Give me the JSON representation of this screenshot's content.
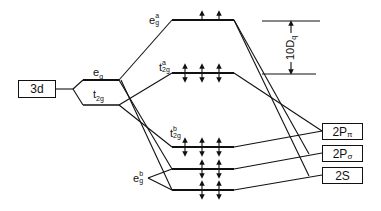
{
  "diagram": {
    "metal_orbital": {
      "label": "3d"
    },
    "metal_split_levels": [
      {
        "name": "eg",
        "main": "e",
        "sub": "g"
      },
      {
        "name": "t2g",
        "main": "t",
        "sub": "2g"
      }
    ],
    "mo_levels": [
      {
        "name": "eg_antibonding",
        "main": "e",
        "sub": "g",
        "sup": "a",
        "electrons": "2 up arrows"
      },
      {
        "name": "t2g_antibonding",
        "main": "t",
        "sub": "2g",
        "sup": "a",
        "electrons": "3 paired (double-headed arrows)"
      },
      {
        "name": "t2g_bonding",
        "main": "t",
        "sub": "2g",
        "sup": "b",
        "electrons": "3 paired (double-headed arrows)"
      },
      {
        "name": "eg_bonding_upper",
        "main": "e",
        "sub": "g",
        "sup": "b",
        "electrons": "2 paired (double-headed arrows)"
      },
      {
        "name": "eg_bonding_lower",
        "electrons": "2 paired (double-headed arrows)"
      }
    ],
    "eg_bonding_label": {
      "main": "e",
      "sub": "g",
      "sup": "b"
    },
    "splitting_label": {
      "text": "10D",
      "sub": "q"
    },
    "ligand_orbitals": [
      {
        "label": "2P",
        "sub": "π"
      },
      {
        "label": "2P",
        "sub": "σ"
      },
      {
        "label": "2S",
        "sub": ""
      }
    ]
  }
}
